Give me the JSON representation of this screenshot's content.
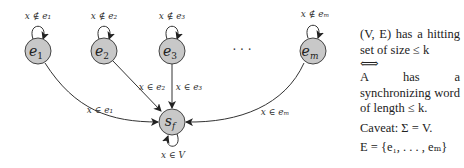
{
  "diagram": {
    "nodes": [
      {
        "id": "e1",
        "label": "e",
        "sub": "1",
        "loop_label": "x ∉ e₁",
        "edge_label": "x ∈ e₁"
      },
      {
        "id": "e2",
        "label": "e",
        "sub": "2",
        "loop_label": "x ∉ e₂",
        "edge_label": "x ∈ e₂"
      },
      {
        "id": "e3",
        "label": "e",
        "sub": "3",
        "loop_label": "x ∉ e₃",
        "edge_label": "x ∈ e₃"
      },
      {
        "id": "em",
        "label": "e",
        "sub": "m",
        "loop_label": "x ∉ eₘ",
        "edge_label": "x ∈ eₘ"
      }
    ],
    "ellipsis": "· · ·",
    "sink": {
      "id": "sf",
      "label": "s",
      "sub": "f",
      "loop_label": "x ∈ V"
    },
    "colors": {
      "node_fill": "#c8c8c8",
      "node_stroke": "#444444",
      "edge": "#333333"
    }
  },
  "side_text": {
    "line1": "(V, E) has a hitting set of size ≤ k",
    "iff": "⟺",
    "line2": "A has a synchronizing word of length ≤ k.",
    "caveat": "Caveat: Σ = V.",
    "edges_def": "E = {e₁, . . . , eₘ}"
  }
}
